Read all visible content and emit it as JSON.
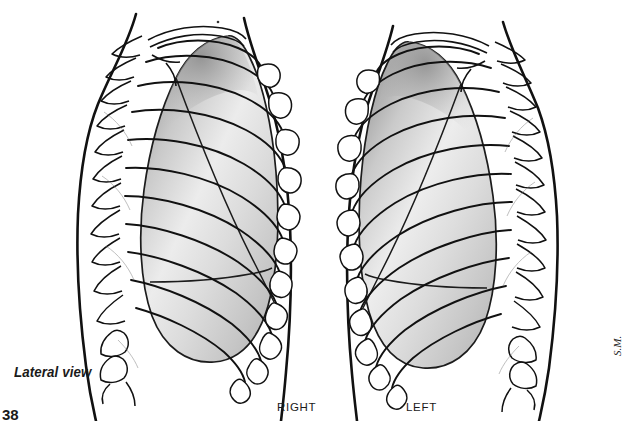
{
  "figure": {
    "kind": "anatomical-illustration",
    "medium": "pen-and-ink line drawing with grayscale wash",
    "background_color": "#ffffff",
    "ink_color": "#111111",
    "caption": "Lateral view",
    "page_number": "38",
    "artist_signature": "S.M.",
    "panels": [
      {
        "id": "right-panel",
        "label": "RIGHT",
        "side": "right",
        "spine_side": "left",
        "lobes": 3,
        "fissures": [
          "oblique",
          "horizontal"
        ]
      },
      {
        "id": "left-panel",
        "label": "LEFT",
        "side": "left",
        "spine_side": "right",
        "lobes": 2,
        "fissures": [
          "oblique"
        ]
      }
    ],
    "shading": {
      "lung_light": "#f2f2f2",
      "lung_mid": "#d8d8d8",
      "lung_dark": "#a9a9a9",
      "lung_apex": "#8f8f8f"
    },
    "rib_count": 11
  }
}
